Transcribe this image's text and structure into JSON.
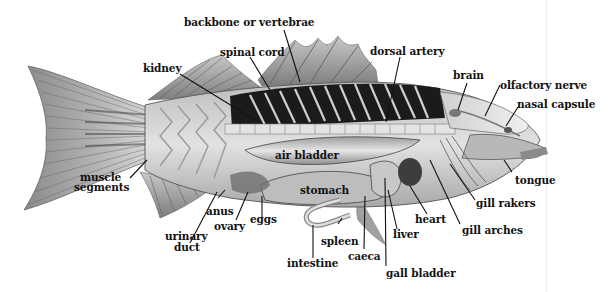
{
  "diagram": {
    "labels": {
      "backbone": "backbone or vertebrae",
      "spinal_cord": "spinal cord",
      "kidney": "kidney",
      "dorsal_artery": "dorsal artery",
      "brain": "brain",
      "olfactory_nerve": "olfactory nerve",
      "nasal_capsule": "nasal capsule",
      "air_bladder": "air bladder",
      "muscle_segments_1": "muscle",
      "muscle_segments_2": "segments",
      "stomach": "stomach",
      "tongue": "tongue",
      "gill_rakers": "gill rakers",
      "heart": "heart",
      "gill_arches": "gill arches",
      "anus": "anus",
      "eggs": "eggs",
      "ovary": "ovary",
      "urinary_duct_1": "urinary",
      "urinary_duct_2": "duct",
      "spleen": "spleen",
      "liver": "liver",
      "caeca": "caeca",
      "intestine": "intestine",
      "gall_bladder": "gall bladder"
    },
    "colors": {
      "background": "#ffffff",
      "label_text": "#111111",
      "leader_line": "#111111",
      "muscle_dark": "#1a1a1a",
      "body_light": "#d9d9d9",
      "fin_gray": "#9a9a9a"
    }
  }
}
